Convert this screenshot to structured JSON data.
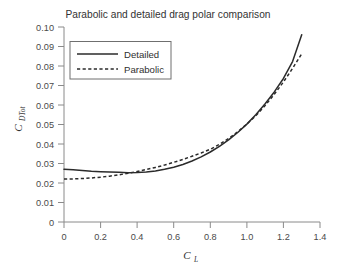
{
  "chart_data": {
    "type": "line",
    "title": "Parabolic and detailed drag polar comparison",
    "xlabel": "C_L",
    "xlabel_main": "C",
    "xlabel_sub": "L",
    "ylabel": "C_DTot",
    "ylabel_main": "C",
    "ylabel_sub": "DTot",
    "xlim": [
      0,
      1.4
    ],
    "ylim": [
      0,
      0.1
    ],
    "grid": false,
    "legend_position": "upper left",
    "xticks": [
      0,
      0.2,
      0.4,
      0.6,
      0.8,
      1.0,
      1.2,
      1.4
    ],
    "xtick_labels": [
      "0",
      "0.2",
      "0.4",
      "0.6",
      "0.8",
      "1.0",
      "1.2",
      "1.4"
    ],
    "yticks": [
      0,
      0.01,
      0.02,
      0.03,
      0.04,
      0.05,
      0.06,
      0.07,
      0.08,
      0.09,
      0.1
    ],
    "ytick_labels": [
      "0",
      "0.01",
      "0.02",
      "0.03",
      "0.04",
      "0.05",
      "0.06",
      "0.07",
      "0.08",
      "0.09",
      "0.10"
    ],
    "series": [
      {
        "name": "Detailed",
        "style": "solid",
        "color": "#2b2b2b",
        "x": [
          0.0,
          0.05,
          0.1,
          0.15,
          0.2,
          0.25,
          0.3,
          0.35,
          0.4,
          0.45,
          0.5,
          0.55,
          0.6,
          0.65,
          0.7,
          0.75,
          0.8,
          0.85,
          0.9,
          0.95,
          1.0,
          1.05,
          1.1,
          1.15,
          1.2,
          1.25,
          1.3
        ],
        "y": [
          0.027,
          0.0268,
          0.0264,
          0.026,
          0.0258,
          0.0257,
          0.0255,
          0.0253,
          0.0254,
          0.0257,
          0.0262,
          0.027,
          0.0281,
          0.0295,
          0.0313,
          0.0334,
          0.0359,
          0.0388,
          0.0421,
          0.0459,
          0.0502,
          0.0551,
          0.0606,
          0.0667,
          0.0736,
          0.0823,
          0.096
        ]
      },
      {
        "name": "Parabolic",
        "style": "dashed",
        "color": "#2b2b2b",
        "x": [
          0.0,
          0.05,
          0.1,
          0.15,
          0.2,
          0.25,
          0.3,
          0.35,
          0.4,
          0.45,
          0.5,
          0.55,
          0.6,
          0.65,
          0.7,
          0.75,
          0.8,
          0.85,
          0.9,
          0.95,
          1.0,
          1.05,
          1.1,
          1.15,
          1.2,
          1.25,
          1.3
        ],
        "y": [
          0.022,
          0.0221,
          0.0223,
          0.0226,
          0.023,
          0.0235,
          0.0242,
          0.025,
          0.0259,
          0.0269,
          0.028,
          0.0292,
          0.0306,
          0.0321,
          0.0337,
          0.0354,
          0.0373,
          0.0398,
          0.0428,
          0.0463,
          0.0502,
          0.0546,
          0.0597,
          0.0655,
          0.0718,
          0.0788,
          0.0862
        ]
      }
    ],
    "legend": [
      {
        "label": "Detailed",
        "style": "solid"
      },
      {
        "label": "Parabolic",
        "style": "dashed"
      }
    ],
    "colors": {
      "background": "#ffffff",
      "axis": "#8a8a8a",
      "line": "#2b2b2b",
      "text": "#333333"
    }
  }
}
